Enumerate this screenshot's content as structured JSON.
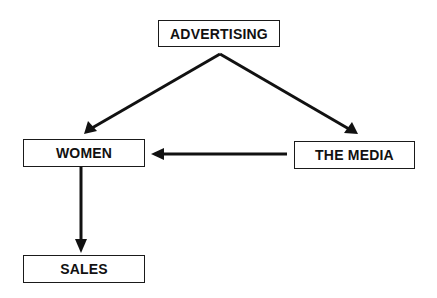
{
  "diagram": {
    "nodes": [
      {
        "id": "advertising",
        "label": "ADVERTISING"
      },
      {
        "id": "women",
        "label": "WOMEN"
      },
      {
        "id": "media",
        "label": "THE MEDIA"
      },
      {
        "id": "sales",
        "label": "SALES"
      }
    ],
    "edges": [
      {
        "from": "advertising",
        "to": "women"
      },
      {
        "from": "advertising",
        "to": "media"
      },
      {
        "from": "media",
        "to": "women"
      },
      {
        "from": "women",
        "to": "sales"
      }
    ],
    "colors": {
      "stroke": "#111111",
      "background": "#ffffff"
    }
  }
}
